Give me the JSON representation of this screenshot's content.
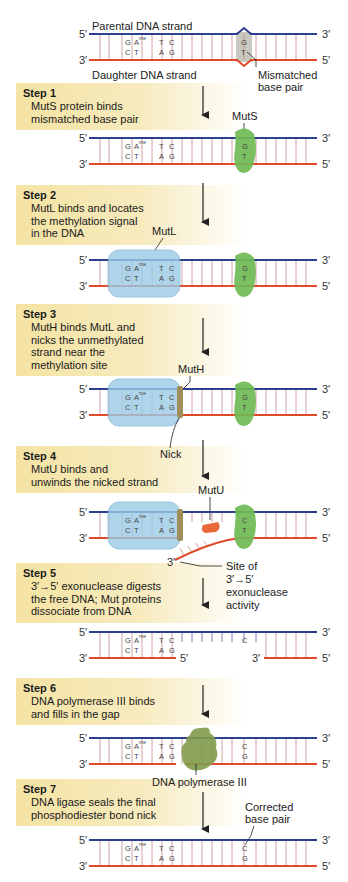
{
  "colors": {
    "parental_strand": "#2d3f8f",
    "daughter_strand": "#e0492a",
    "step_box": "#f5e6ad",
    "muts": "#6fba55",
    "mutl": "#9ccbe6",
    "muth": "#a08e5a",
    "mutu": "#e8683a",
    "polymerase": "#7f9a4a"
  },
  "top": {
    "parental_label": "Parental DNA strand",
    "daughter_label": "Daughter DNA strand",
    "mismatch_label_1": "Mismatched",
    "mismatch_label_2": "base pair"
  },
  "ends": {
    "five": "5′",
    "three": "3′"
  },
  "bases": {
    "top": [
      "G",
      "A",
      "T",
      "C"
    ],
    "top_methyl": "me",
    "bottom": [
      "C",
      "T",
      "A",
      "G"
    ],
    "mismatch_top": "G",
    "mismatch_bottom": "T",
    "step4_top": "C",
    "step4_bottom": "T",
    "gap_top": "C",
    "corrected_top": "C",
    "corrected_bottom": "G"
  },
  "steps": [
    {
      "title": "Step 1",
      "lines": [
        "MutS protein binds",
        "mismatched base pair"
      ]
    },
    {
      "title": "Step 2",
      "lines": [
        "MutL binds and locates",
        "the methylation signal",
        "in the DNA"
      ]
    },
    {
      "title": "Step 3",
      "lines": [
        "MutH binds MutL and",
        "nicks the unmethylated",
        "strand near the",
        "methylation site"
      ]
    },
    {
      "title": "Step 4",
      "lines": [
        "MutU binds and",
        "unwinds the nicked strand"
      ]
    },
    {
      "title": "Step 5",
      "lines": [
        "3′→5′ exonuclease digests",
        "the free DNA; Mut proteins",
        "dissociate from DNA"
      ]
    },
    {
      "title": "Step 6",
      "lines": [
        "DNA polymerase III binds",
        "and fills in the gap"
      ]
    },
    {
      "title": "Step 7",
      "lines": [
        "DNA ligase seals the final",
        "phosphodiester bond nick"
      ]
    }
  ],
  "proteins": {
    "muts": "MutS",
    "mutl": "MutL",
    "muth": "MutH",
    "mutu": "MutU",
    "polymerase": "DNA polymerase III"
  },
  "annotations": {
    "nick": "Nick",
    "exo_site_1": "Site of",
    "exo_site_2": "3′→5′",
    "exo_site_3": "exonuclease",
    "exo_site_4": "activity",
    "corrected_1": "Corrected",
    "corrected_2": "base pair"
  }
}
